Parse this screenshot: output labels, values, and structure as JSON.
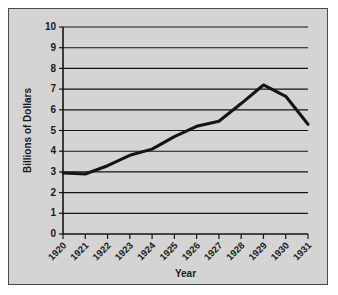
{
  "figure": {
    "background_color": "#d4d4d4",
    "border_color": "#4a4a4a",
    "line_color": "#151515",
    "axis_color": "#141414"
  },
  "chart_data": {
    "type": "line",
    "title": "",
    "xlabel": "Year",
    "ylabel": "Billions of Dollars",
    "categories": [
      "1920",
      "1921",
      "1922",
      "1923",
      "1924",
      "1925",
      "1926",
      "1927",
      "1928",
      "1929",
      "1930",
      "1931"
    ],
    "x": [
      1920,
      1921,
      1922,
      1923,
      1924,
      1925,
      1926,
      1927,
      1928,
      1929,
      1930,
      1931
    ],
    "values": [
      2.95,
      2.9,
      3.3,
      3.8,
      4.1,
      4.7,
      5.2,
      5.45,
      6.3,
      7.2,
      6.65,
      5.3
    ],
    "ylim": [
      0,
      10
    ],
    "ytick_labels": [
      "0",
      "1",
      "2",
      "3",
      "4",
      "5",
      "6",
      "7",
      "8",
      "9",
      "10"
    ],
    "ytick_values": [
      0,
      1,
      2,
      3,
      4,
      5,
      6,
      7,
      8,
      9,
      10
    ],
    "xtick_labels": [
      "1920",
      "1921",
      "1922",
      "1923",
      "1924",
      "1925",
      "1926",
      "1927",
      "1928",
      "1929",
      "1930",
      "1931"
    ],
    "xtick_rotation_degrees": -45,
    "grid": "horizontal",
    "legend": "none",
    "series": [
      {
        "name": "Billions of Dollars",
        "values": [
          2.95,
          2.9,
          3.3,
          3.8,
          4.1,
          4.7,
          5.2,
          5.45,
          6.3,
          7.2,
          6.65,
          5.3
        ]
      }
    ]
  }
}
